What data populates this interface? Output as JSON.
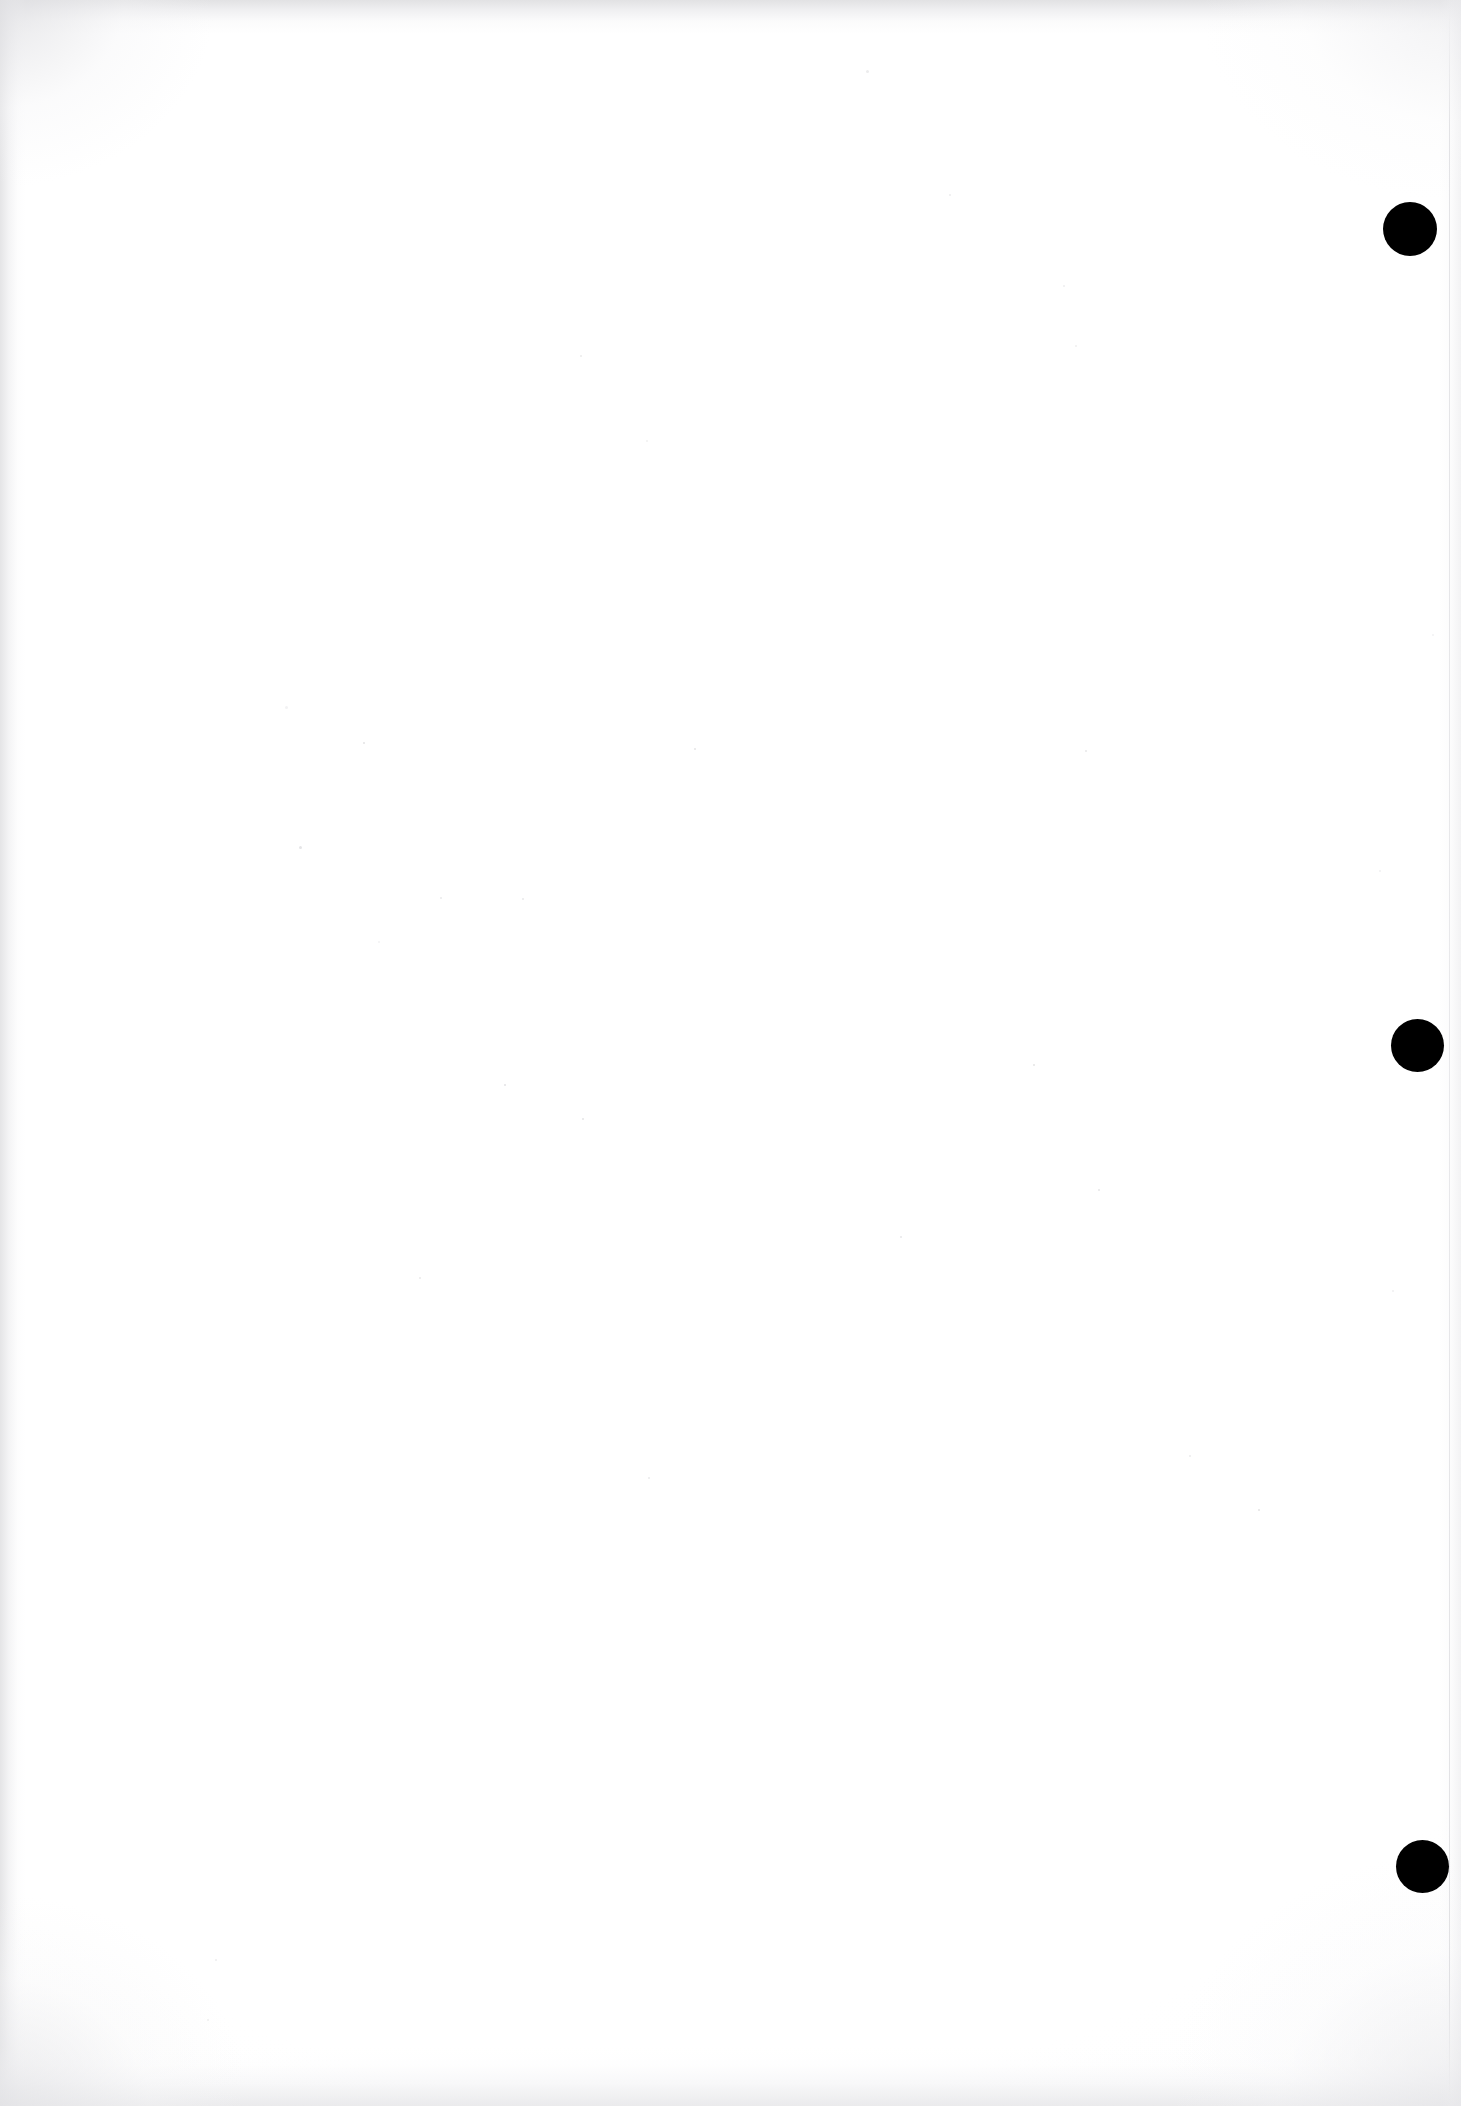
{
  "document": {
    "kind": "scanned-page",
    "page_label": "",
    "body_text": "",
    "content_note": "blank page",
    "width_px": 1461,
    "height_px": 2106
  },
  "colors": {
    "paper": "#ffffff",
    "mark": "#000000",
    "edge_shadow": "#e2e2e4",
    "dust": "#b2b2b6"
  },
  "marks": {
    "label": "binding-mark",
    "items": [
      {
        "name": "binding-mark-top",
        "cx": 1410,
        "cy": 229,
        "d": 54
      },
      {
        "name": "binding-mark-middle",
        "cx": 1417,
        "cy": 1045,
        "d": 53
      },
      {
        "name": "binding-mark-bottom",
        "cx": 1422,
        "cy": 1866,
        "d": 53
      }
    ]
  },
  "edges": {
    "right_edge_x": 1449
  },
  "specks": [
    {
      "x": 285,
      "y": 706,
      "s": 3
    },
    {
      "x": 363,
      "y": 742,
      "s": 2
    },
    {
      "x": 694,
      "y": 748,
      "s": 2
    },
    {
      "x": 299,
      "y": 846,
      "s": 3
    },
    {
      "x": 1085,
      "y": 750,
      "s": 2
    },
    {
      "x": 522,
      "y": 898,
      "s": 2
    },
    {
      "x": 440,
      "y": 897,
      "s": 2
    },
    {
      "x": 580,
      "y": 355,
      "s": 2
    },
    {
      "x": 866,
      "y": 70,
      "s": 3
    },
    {
      "x": 949,
      "y": 194,
      "s": 2
    },
    {
      "x": 1063,
      "y": 285,
      "s": 2
    },
    {
      "x": 1075,
      "y": 345,
      "s": 2
    },
    {
      "x": 646,
      "y": 440,
      "s": 2
    },
    {
      "x": 378,
      "y": 941,
      "s": 2
    },
    {
      "x": 504,
      "y": 1084,
      "s": 2
    },
    {
      "x": 1033,
      "y": 1064,
      "s": 2
    },
    {
      "x": 582,
      "y": 1118,
      "s": 2
    },
    {
      "x": 1098,
      "y": 1189,
      "s": 2
    },
    {
      "x": 900,
      "y": 1236,
      "s": 2
    },
    {
      "x": 419,
      "y": 1277,
      "s": 2
    },
    {
      "x": 648,
      "y": 1477,
      "s": 2
    },
    {
      "x": 1189,
      "y": 1455,
      "s": 2
    },
    {
      "x": 215,
      "y": 1959,
      "s": 2
    },
    {
      "x": 207,
      "y": 2019,
      "s": 2
    },
    {
      "x": 1392,
      "y": 1290,
      "s": 2
    },
    {
      "x": 1379,
      "y": 870,
      "s": 2
    },
    {
      "x": 1432,
      "y": 634,
      "s": 2
    },
    {
      "x": 1258,
      "y": 1509,
      "s": 2
    }
  ]
}
